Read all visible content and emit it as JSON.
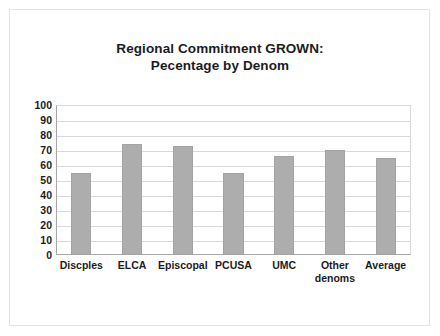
{
  "slide": {
    "background_color": "#ffffff",
    "border_color": "#e3e3e3"
  },
  "chart_data": {
    "type": "bar",
    "title": "Regional Commitment GROWN:",
    "subtitle": "Pecentage by Denom",
    "title_line1": "Regional Commitment GROWN:",
    "title_line2": "Pecentage by Denom",
    "xlabel": "",
    "ylabel": "",
    "categories": [
      "Discples",
      "ELCA",
      "Episcopal",
      "PCUSA",
      "UMC",
      "Other\ndenoms",
      "Average"
    ],
    "values": [
      55,
      74,
      73,
      55,
      66,
      70,
      65
    ],
    "ylim": [
      0,
      100
    ],
    "ytick_labels": [
      "100",
      "90",
      "80",
      "70",
      "60",
      "50",
      "40",
      "30",
      "20",
      "10",
      "0"
    ],
    "ytick_values": [
      100,
      90,
      80,
      70,
      60,
      50,
      40,
      30,
      20,
      10,
      0
    ],
    "grid": true,
    "legend": false,
    "bar_color": "#adadad",
    "bar_border_color": "#a3a3a3",
    "gridline_color": "#d8d8d8",
    "axis_color": "#a6a6a6",
    "text_color": "#1c1c1c"
  }
}
